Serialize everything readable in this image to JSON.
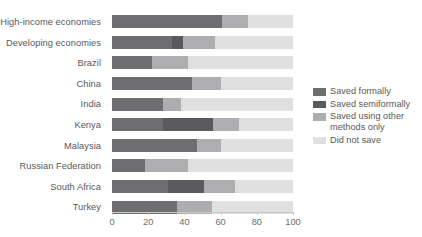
{
  "chart_data": {
    "type": "bar",
    "orientation": "horizontal",
    "stacked": true,
    "title": "",
    "subtitle": "",
    "xlabel": "",
    "ylabel": "",
    "xlim": [
      0,
      100
    ],
    "xticks": [
      0,
      20,
      40,
      60,
      80,
      100
    ],
    "xtick_labels": [
      "0",
      "20",
      "40",
      "60",
      "80",
      "100"
    ],
    "grid": false,
    "legend_position": "right",
    "categories": [
      "High-income economies",
      "Developing economies",
      "Brazil",
      "China",
      "India",
      "Kenya",
      "Malaysia",
      "Russian Federation",
      "South Africa",
      "Turkey"
    ],
    "series": [
      {
        "name": "Saved formally",
        "color": "#6e6e70",
        "values": [
          61,
          33,
          22,
          44,
          28,
          28,
          47,
          18,
          31,
          36
        ]
      },
      {
        "name": "Saved semiformally",
        "color": "#5a5a5c",
        "values": [
          0,
          6,
          0,
          0,
          0,
          28,
          0,
          0,
          20,
          0
        ]
      },
      {
        "name": "Saved using other methods only",
        "color": "#aeaeb0",
        "values": [
          14,
          18,
          20,
          16,
          10,
          14,
          13,
          24,
          17,
          19
        ]
      },
      {
        "name": "Did not save",
        "color": "#e0e0e0",
        "values": [
          25,
          43,
          58,
          40,
          62,
          30,
          40,
          58,
          32,
          45
        ]
      }
    ]
  },
  "legend": {
    "items": [
      {
        "label": "Saved formally",
        "color": "#6e6e70"
      },
      {
        "label": "Saved semiformally",
        "color": "#5a5a5c"
      },
      {
        "label": "Saved using other\nmethods only",
        "color": "#aeaeb0"
      },
      {
        "label": "Did not save",
        "color": "#e0e0e0"
      }
    ]
  },
  "axis": {
    "tick_labels": [
      "0",
      "20",
      "40",
      "60",
      "80",
      "100"
    ]
  }
}
